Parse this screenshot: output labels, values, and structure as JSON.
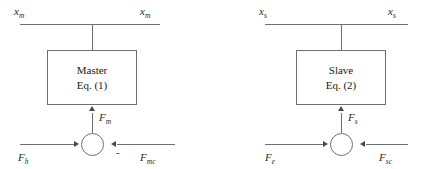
{
  "figure": {
    "stroke_color": "#6e6e6e",
    "arrow_color": "#4a4a4a",
    "text_color": "#2b2b2b",
    "background": "#ffffff"
  },
  "master": {
    "block": {
      "name_label": "Master",
      "equation_label": "Eq. (1)"
    },
    "top_left_signal": {
      "base": "x",
      "sub": "m"
    },
    "top_right_signal": {
      "base": "x",
      "sub": "m"
    },
    "junction_output_signal": {
      "base": "F",
      "sub": "m"
    },
    "bottom_left_signal": {
      "base": "F",
      "sub": "h"
    },
    "bottom_right_signal": {
      "base": "F",
      "sub": "mc"
    },
    "junction_sign": "-"
  },
  "slave": {
    "block": {
      "name_label": "Slave",
      "equation_label": "Eq. (2)"
    },
    "top_left_signal": {
      "base": "x",
      "sub": "s"
    },
    "top_right_signal": {
      "base": "x",
      "sub": "s"
    },
    "junction_output_signal": {
      "base": "F",
      "sub": "s"
    },
    "bottom_left_signal": {
      "base": "F",
      "sub": "e"
    },
    "bottom_right_signal": {
      "base": "F",
      "sub": "sc"
    }
  }
}
